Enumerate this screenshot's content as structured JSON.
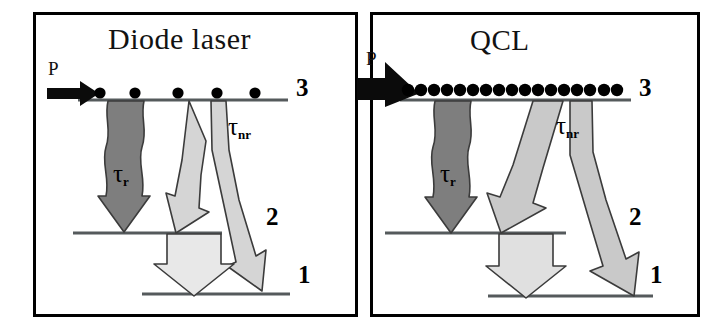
{
  "figure": {
    "kind": "energy-level-diagram",
    "background": "#ffffff",
    "border_color": "#000000"
  },
  "panels": [
    {
      "id": "diode",
      "title": "Diode laser",
      "pump": {
        "label": "P",
        "style": "small-black-arrow",
        "relative_strength": "low"
      },
      "carriers": {
        "count": 5,
        "spacing": "sparse",
        "color": "#000000"
      },
      "levels": [
        {
          "name": "3",
          "label": "3"
        },
        {
          "name": "2",
          "label": "2"
        },
        {
          "name": "1",
          "label": "1"
        }
      ],
      "transitions": [
        {
          "name": "radiative",
          "label": "τ",
          "sub": "r",
          "from": "3",
          "to": "2",
          "style": "wavy-arrow",
          "color": "#7e7e7e",
          "width": "narrow"
        },
        {
          "name": "nonradiative",
          "label": "τ",
          "sub": "nr",
          "from": "3",
          "to": "2 and 1",
          "style": "forked-arrow",
          "color": "#d5d5d5",
          "width": "narrow"
        },
        {
          "name": "depopulation",
          "label": "",
          "sub": "",
          "from": "2",
          "to": "1",
          "style": "block-arrow",
          "color": "#e8e8e8",
          "width": "medium"
        }
      ]
    },
    {
      "id": "qcl",
      "title": "QCL",
      "pump": {
        "label": "P",
        "style": "large-black-arrow",
        "relative_strength": "high"
      },
      "carriers": {
        "count": 17,
        "spacing": "dense",
        "color": "#000000"
      },
      "levels": [
        {
          "name": "3",
          "label": "3"
        },
        {
          "name": "2",
          "label": "2"
        },
        {
          "name": "1",
          "label": "1"
        }
      ],
      "transitions": [
        {
          "name": "radiative",
          "label": "τ",
          "sub": "r",
          "from": "3",
          "to": "2",
          "style": "wavy-arrow",
          "color": "#7e7e7e",
          "width": "narrow"
        },
        {
          "name": "nonradiative",
          "label": "τ",
          "sub": "nr",
          "from": "3",
          "to": "2 and 1",
          "style": "forked-arrow",
          "color": "#c9c9c9",
          "width": "wide"
        },
        {
          "name": "depopulation",
          "label": "",
          "sub": "",
          "from": "2",
          "to": "1",
          "style": "block-arrow",
          "color": "#e0e0e0",
          "width": "medium"
        }
      ]
    }
  ],
  "labels": {
    "tau_symbol": "τ",
    "sub_radiative": "r",
    "sub_nonradiative": "nr",
    "level_3": "3",
    "level_2": "2",
    "level_1": "1",
    "pump": "P"
  },
  "colors": {
    "dark_gray_arrow": "#7e7e7e",
    "light_gray_arrow": "#d5d5d5",
    "mid_gray_arrow": "#c9c9c9",
    "pale_arrow": "#e8e8e8",
    "level_line": "#555a5c",
    "outline": "#3b3b3b"
  }
}
